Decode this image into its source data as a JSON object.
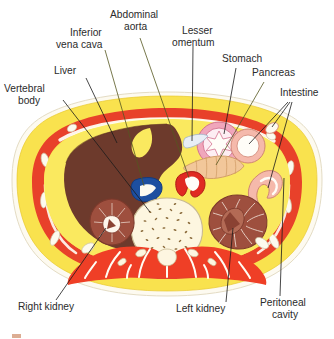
{
  "figure": {
    "background_color": "#ffffff"
  },
  "labels": [
    {
      "id": "vertebral-body",
      "text_lines": [
        "Vertebral",
        "body"
      ],
      "x": 4,
      "y": 92,
      "anchor": "start"
    },
    {
      "id": "liver",
      "text_lines": [
        "Liver"
      ],
      "x": 54,
      "y": 74,
      "anchor": "start"
    },
    {
      "id": "inferior-vena-cava",
      "text_lines": [
        "Inferior",
        "vena cava"
      ],
      "x": 62,
      "y": 36,
      "anchor": "start"
    },
    {
      "id": "abdominal-aorta",
      "text_lines": [
        "Abdominal",
        "aorta"
      ],
      "x": 108,
      "y": 18,
      "anchor": "start"
    },
    {
      "id": "lesser-omentum",
      "text_lines": [
        "Lesser",
        "omentum"
      ],
      "x": 174,
      "y": 34,
      "anchor": "start"
    },
    {
      "id": "stomach",
      "text_lines": [
        "Stomach"
      ],
      "x": 222,
      "y": 62,
      "anchor": "start"
    },
    {
      "id": "pancreas",
      "text_lines": [
        "Pancreas"
      ],
      "x": 252,
      "y": 76,
      "anchor": "start"
    },
    {
      "id": "intestine",
      "text_lines": [
        "Intestine"
      ],
      "x": 280,
      "y": 96,
      "anchor": "start"
    },
    {
      "id": "right-kidney",
      "text_lines": [
        "Right kidney"
      ],
      "x": 18,
      "y": 310,
      "anchor": "start"
    },
    {
      "id": "left-kidney",
      "text_lines": [
        "Left kidney"
      ],
      "x": 176,
      "y": 312,
      "anchor": "start"
    },
    {
      "id": "peritoneal-cavity",
      "text_lines": [
        "Peritoneal",
        "cavity"
      ],
      "x": 260,
      "y": 306,
      "anchor": "start"
    }
  ],
  "structures": [
    {
      "id": "skin-outline",
      "name": "Skin / body outline",
      "color": "#fdfbf2"
    },
    {
      "id": "subcutaneous-fat",
      "name": "Subcutaneous fat",
      "color": "#f8e04a"
    },
    {
      "id": "muscle-wall",
      "name": "Abdominal wall muscle",
      "color": "#e8412a"
    },
    {
      "id": "peritoneal-fat",
      "name": "Peritoneal / intra-abdominal fat",
      "color": "#fae85e"
    },
    {
      "id": "liver-organ",
      "name": "Liver",
      "color": "#6d3a2c"
    },
    {
      "id": "stomach-organ",
      "name": "Stomach",
      "color": "#f0a6bb"
    },
    {
      "id": "pancreas-organ",
      "name": "Pancreas",
      "color": "#f2c79a"
    },
    {
      "id": "intestine-organ",
      "name": "Intestine",
      "color": "#f5b9ab"
    },
    {
      "id": "kidney-organ",
      "name": "Kidney",
      "color": "#9e4f3e"
    },
    {
      "id": "aorta-vessel",
      "name": "Abdominal aorta",
      "color": "#e02a22"
    },
    {
      "id": "ivc-vessel",
      "name": "Inferior vena cava",
      "color": "#1d4fa0"
    },
    {
      "id": "vertebra-bone",
      "name": "Vertebral body",
      "color": "#fdf6e0"
    },
    {
      "id": "back-muscle",
      "name": "Back (erector spinae) muscle",
      "color": "#ef3f26"
    },
    {
      "id": "spinal-cord",
      "name": "Spinal cord / canal",
      "color": "#f0b49a"
    }
  ],
  "caption": {
    "visible_fragment": "",
    "note": ""
  }
}
